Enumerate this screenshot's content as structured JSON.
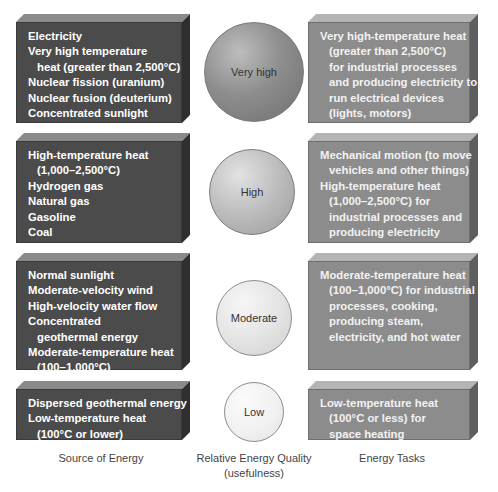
{
  "colors": {
    "source_box": "#4b4b4b",
    "task_box": "#8c8c8c",
    "sphere_very_high": "#8a8a8a",
    "sphere_high": "#b8b8b8",
    "sphere_moderate": "#e4e4e4",
    "sphere_low": "#f1f1f1"
  },
  "rows": [
    {
      "quality": "Very high",
      "sources": [
        {
          "text": "Electricity",
          "indent": false
        },
        {
          "text": "Very high temperature",
          "indent": false
        },
        {
          "text": "heat (greater than 2,500°C)",
          "indent": true
        },
        {
          "text": "Nuclear fission (uranium)",
          "indent": false
        },
        {
          "text": "Nuclear fusion (deuterium)",
          "indent": false
        },
        {
          "text": "Concentrated sunlight",
          "indent": false
        },
        {
          "text": "High-velocity wind",
          "indent": false
        }
      ],
      "tasks": [
        {
          "text": "Very high-temperature heat",
          "indent": false
        },
        {
          "text": "(greater than 2,500°C)",
          "indent": true
        },
        {
          "text": "for industrial processes",
          "indent": true
        },
        {
          "text": "and producing electricity to",
          "indent": true
        },
        {
          "text": "run electrical devices",
          "indent": true
        },
        {
          "text": "(lights, motors)",
          "indent": true
        }
      ]
    },
    {
      "quality": "High",
      "sources": [
        {
          "text": "High-temperature heat",
          "indent": false
        },
        {
          "text": "(1,000–2,500°C)",
          "indent": true
        },
        {
          "text": "Hydrogen gas",
          "indent": false
        },
        {
          "text": "Natural gas",
          "indent": false
        },
        {
          "text": "Gasoline",
          "indent": false
        },
        {
          "text": "Coal",
          "indent": false
        },
        {
          "text": "Food",
          "indent": false
        }
      ],
      "tasks": [
        {
          "text": "Mechanical motion (to move",
          "indent": false
        },
        {
          "text": "vehicles and other things)",
          "indent": true
        },
        {
          "text": "High-temperature heat",
          "indent": false
        },
        {
          "text": "(1,000–2,500°C) for",
          "indent": true
        },
        {
          "text": "industrial processes and",
          "indent": true
        },
        {
          "text": "producing electricity",
          "indent": true
        }
      ]
    },
    {
      "quality": "Moderate",
      "sources": [
        {
          "text": "Normal sunlight",
          "indent": false
        },
        {
          "text": "Moderate-velocity wind",
          "indent": false
        },
        {
          "text": "High-velocity water flow",
          "indent": false
        },
        {
          "text": "Concentrated",
          "indent": false
        },
        {
          "text": "geothermal energy",
          "indent": true
        },
        {
          "text": "Moderate-temperature heat",
          "indent": false
        },
        {
          "text": "(100–1,000°C)",
          "indent": true
        },
        {
          "text": "Wood and crop wastes",
          "indent": false
        }
      ],
      "tasks": [
        {
          "text": "Moderate-temperature heat",
          "indent": false
        },
        {
          "text": "(100–1,000°C) for industrial",
          "indent": true
        },
        {
          "text": "processes, cooking,",
          "indent": true
        },
        {
          "text": "producing steam,",
          "indent": true
        },
        {
          "text": "electricity, and hot water",
          "indent": true
        }
      ]
    },
    {
      "quality": "Low",
      "sources": [
        {
          "text": "Dispersed geothermal energy",
          "indent": false
        },
        {
          "text": "Low-temperature heat",
          "indent": false
        },
        {
          "text": "(100°C or lower)",
          "indent": true
        }
      ],
      "tasks": [
        {
          "text": "Low-temperature heat",
          "indent": false
        },
        {
          "text": "(100°C or less) for",
          "indent": true
        },
        {
          "text": "space heating",
          "indent": true
        }
      ]
    }
  ],
  "column_labels": {
    "source": "Source of Energy",
    "quality_line1": "Relative Energy Quality",
    "quality_line2": "(usefulness)",
    "tasks": "Energy Tasks"
  }
}
